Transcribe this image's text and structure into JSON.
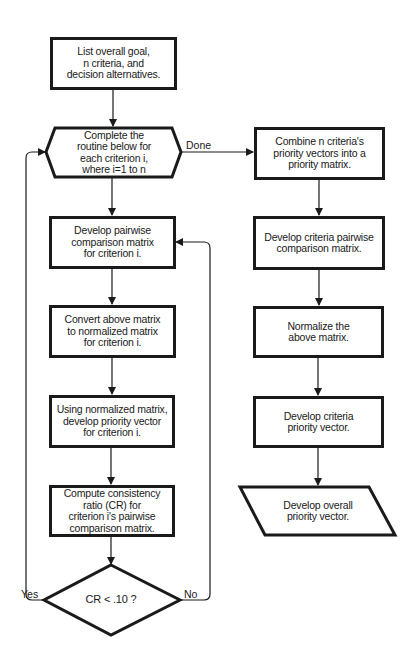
{
  "flowchart": {
    "start": {
      "text": "List overall goal,\nn criteria, and\ndecision alternatives."
    },
    "loop": {
      "text": "Complete the\nroutine below for\neach criterion i,\nwhere i=1 to n"
    },
    "left_steps": [
      {
        "text": "Develop pairwise\ncomparison matrix\nfor criterion i."
      },
      {
        "text": "Convert above matrix\nto normalized matrix\nfor criterion i."
      },
      {
        "text": "Using normalized matrix,\ndevelop priority vector\nfor criterion i."
      },
      {
        "text": "Compute consistency\nratio (CR) for\ncriterion i's pairwise\ncomparison matrix."
      }
    ],
    "decision": {
      "text": "CR < .10 ?",
      "yes_label": "Yes",
      "no_label": "No"
    },
    "done_label": "Done",
    "right_steps": [
      {
        "text": "Combine n criteria's\npriority vectors into a\npriority matrix."
      },
      {
        "text": "Develop criteria pairwise\ncomparison matrix."
      },
      {
        "text": "Normalize the\nabove matrix."
      },
      {
        "text": "Develop criteria\npriority vector."
      }
    ],
    "end": {
      "text": "Develop overall\npriority vector."
    }
  },
  "colors": {
    "stroke": "#1a1a1a",
    "background": "#ffffff"
  }
}
